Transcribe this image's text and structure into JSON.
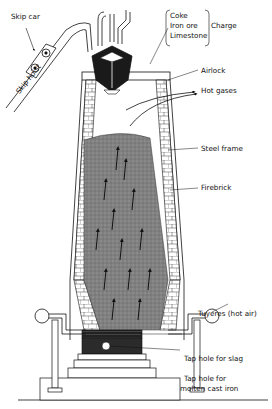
{
  "diagram": {
    "type": "labeled cross-section",
    "labels": {
      "skip_car": "Skip car",
      "skip_hoist": "Skip hoist",
      "charge_items": [
        "Coke",
        "Iron ore",
        "Limestone"
      ],
      "charge": "Charge",
      "airlock": "Airlock",
      "hot_gases": "Hot gases",
      "steel_frame": "Steel frame",
      "firebrick": "Firebrick",
      "tuyeres": "Tuyeres (hot air)",
      "tap_slag": "Tap hole for slag",
      "tap_iron_line1": "Tap hole for",
      "tap_iron_line2": "molten cast iron"
    },
    "colors": {
      "line": "#111111",
      "charge_fill": "#7d7d7d",
      "hopper_fill": "#1a1a1a",
      "slag_fill": "#2a2a2a",
      "background": "#ffffff"
    }
  }
}
